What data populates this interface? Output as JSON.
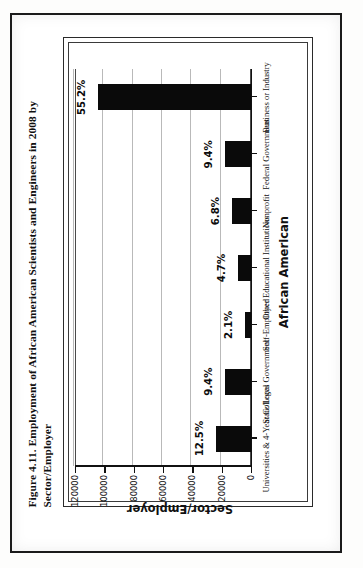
{
  "figure": {
    "caption": "Figure 4.11.  Employment of African American Scientists and Engineers in 2008 by Sector/Employer"
  },
  "chart_data": {
    "type": "bar",
    "title": "",
    "orientation": "vertical",
    "categories": [
      "Universities & 4-Year Colleges",
      "State/Local Government",
      "Self-Employed",
      "Other Educational Institutions",
      "Nonprofit",
      "Federal Government",
      "Business or Industry"
    ],
    "values": [
      23600,
      17800,
      4000,
      8900,
      12800,
      17800,
      104400
    ],
    "data_labels": [
      "12.5%",
      "9.4%",
      "2.1%",
      "4.7%",
      "6.8%",
      "9.4%",
      "55.2%"
    ],
    "percentages": [
      12.5,
      9.4,
      2.1,
      4.7,
      6.8,
      9.4,
      55.2
    ],
    "xlabel": "Sector/Employer",
    "ylabel": "African American",
    "ylim": [
      0,
      120000
    ],
    "yticks": [
      0,
      20000,
      40000,
      60000,
      80000,
      100000,
      120000
    ],
    "ytick_labels": [
      "0",
      "20000",
      "40000",
      "60000",
      "80000",
      "100000",
      "120000"
    ],
    "grid": "horizontal",
    "legend": "none",
    "bar_color": "#0a0a0a"
  }
}
